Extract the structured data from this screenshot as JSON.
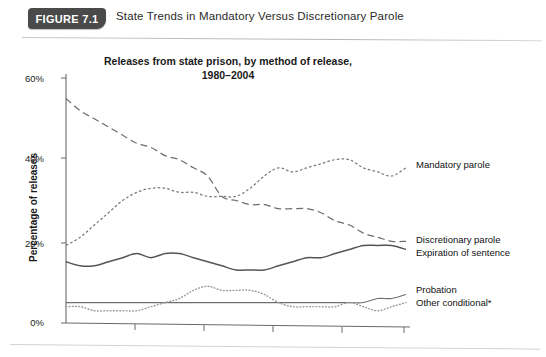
{
  "figure": {
    "badge_label": "FIGURE 7.1",
    "caption": "State Trends in Mandatory Versus Discretionary Parole"
  },
  "chart_data": {
    "type": "line",
    "title": "Releases from state prison, by method of release, 1980–2004",
    "xlabel": "",
    "ylabel": "Percentage of releases",
    "ylim": [
      0,
      60
    ],
    "xlim": [
      1980,
      2004
    ],
    "ytick_labels": [
      "0%",
      "20%",
      "40%",
      "60%"
    ],
    "ytick_values": [
      0,
      20,
      40,
      60
    ],
    "xtick_values": [
      1980,
      1985,
      1990,
      1995,
      2000,
      2004
    ],
    "xtick_labels": [
      "",
      "",
      "",
      "",
      "",
      ""
    ],
    "grid": false,
    "legend_position": "right-inline",
    "footnote": "*",
    "x": [
      1980,
      1981,
      1982,
      1983,
      1984,
      1985,
      1986,
      1987,
      1988,
      1989,
      1990,
      1991,
      1992,
      1993,
      1994,
      1995,
      1996,
      1997,
      1998,
      1999,
      2000,
      2001,
      2002,
      2003,
      2004
    ],
    "series": [
      {
        "name": "Discretionary parole",
        "style": "long-dash",
        "color": "#6d6d6d",
        "values": [
          55,
          52,
          50,
          48,
          46,
          44,
          43,
          41,
          40,
          38,
          36,
          31,
          30,
          29,
          29,
          28,
          28,
          28,
          27,
          25,
          24,
          22,
          21,
          20,
          20
        ]
      },
      {
        "name": "Mandatory parole",
        "style": "short-dash",
        "color": "#7a7a7a",
        "values": [
          19,
          21,
          24,
          27,
          30,
          32,
          33,
          33,
          32,
          32,
          31,
          31,
          31,
          33,
          36,
          38,
          37,
          38,
          39,
          40,
          40,
          38,
          37,
          36,
          38
        ]
      },
      {
        "name": "Expiration of sentence",
        "style": "solid",
        "color": "#555555",
        "values": [
          15,
          14,
          14,
          15,
          16,
          17,
          16,
          17,
          17,
          16,
          15,
          14,
          13,
          13,
          13,
          14,
          15,
          16,
          16,
          17,
          18,
          19,
          19,
          19,
          18
        ]
      },
      {
        "name": "Probation",
        "style": "solid-thin",
        "color": "#6f6f6f",
        "values": [
          5,
          5,
          5,
          5,
          5,
          5,
          5,
          5,
          5,
          5,
          5,
          5,
          5,
          5,
          5,
          5,
          5,
          5,
          5,
          5,
          5,
          5,
          6,
          6,
          7
        ]
      },
      {
        "name": "Other conditional*",
        "style": "dotted",
        "color": "#9a9a9a",
        "values": [
          4,
          4,
          3,
          3,
          3,
          3,
          4,
          5,
          6,
          8,
          9,
          8,
          8,
          8,
          7,
          5,
          4,
          4,
          4,
          4,
          5,
          4,
          3,
          4,
          5
        ]
      }
    ]
  }
}
